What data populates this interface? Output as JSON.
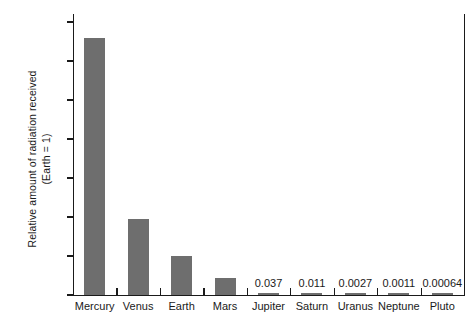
{
  "chart_data": {
    "type": "bar",
    "title": "",
    "xlabel": "",
    "ylabel": "Relative amount of radiation received (Earth = 1)",
    "ylabel_line1": "Relative amount of radiation received",
    "ylabel_line2": "(Earth = 1)",
    "ylim": [
      0.0,
      7.0
    ],
    "ytick_labels": [
      "0.00",
      "1.00",
      "2.00",
      "3.00",
      "4.00",
      "5.00",
      "6.00",
      "7.00"
    ],
    "ytick_values": [
      0.0,
      1.0,
      2.0,
      3.0,
      4.0,
      5.0,
      6.0,
      7.0
    ],
    "grid": false,
    "legend": false,
    "categories": [
      "Mercury",
      "Venus",
      "Earth",
      "Mars",
      "Jupiter",
      "Saturn",
      "Uranus",
      "Neptune",
      "Pluto"
    ],
    "values": [
      6.6,
      1.94,
      1.0,
      0.43,
      0.037,
      0.011,
      0.0027,
      0.0011,
      0.00064
    ],
    "point_labels": [
      "",
      "",
      "",
      "",
      "0.037",
      "0.011",
      "0.0027",
      "0.0011",
      "0.00064"
    ],
    "bar_color": "#6e6e6e",
    "axis_color": "#1a1a1a",
    "background_color": "#ffffff"
  }
}
